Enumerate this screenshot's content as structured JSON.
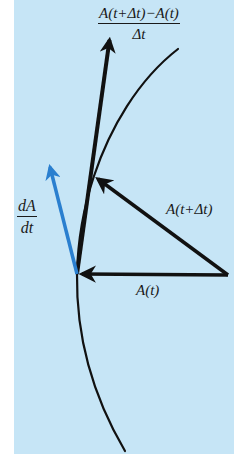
{
  "diagram": {
    "colors": {
      "background": "#c6e5f6",
      "ink": "#111111",
      "derivative_arrow": "#2a7fcf"
    },
    "labels": {
      "difference_quotient": {
        "numerator": "A(t+Δt)−A(t)",
        "denominator": "Δt"
      },
      "derivative": {
        "numerator": "dA",
        "denominator": "dt"
      },
      "vector_at_t_plus_dt": "A(t+Δt)",
      "vector_at_t": "A(t)"
    },
    "geometry": {
      "origin_point": [
        77,
        274
      ],
      "tail_point": [
        228,
        275
      ],
      "curve_point_t_plus_dt": [
        94,
        176
      ],
      "difference_quotient_tip": [
        110,
        36
      ],
      "derivative_tip": [
        48,
        163
      ],
      "curve_top": [
        178,
        49
      ],
      "curve_bottom": [
        125,
        451
      ]
    }
  }
}
